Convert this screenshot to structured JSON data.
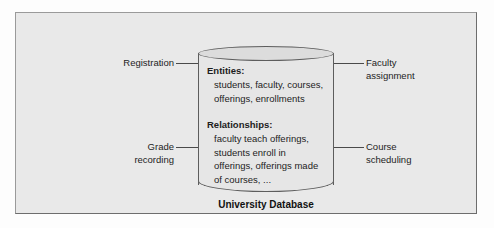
{
  "diagram": {
    "caption": "University Database",
    "cylinder": {
      "entities_heading": "Entities:",
      "entities_text": "students, faculty, courses, offerings, enrollments",
      "relationships_heading": "Relationships:",
      "relationships_text": "faculty teach offerings, students enroll in offerings, offerings made of courses, ..."
    },
    "callouts": [
      {
        "id": "registration",
        "label": "Registration",
        "side": "left",
        "position": "top"
      },
      {
        "id": "grade",
        "label": "Grade\nrecording",
        "side": "left",
        "position": "bottom"
      },
      {
        "id": "faculty",
        "label": "Faculty\nassignment",
        "side": "right",
        "position": "top"
      },
      {
        "id": "course",
        "label": "Course\nscheduling",
        "side": "right",
        "position": "bottom"
      }
    ],
    "colors": {
      "panel_background": "#e9e9e9",
      "panel_border": "#9a9a9a",
      "cylinder_fill": "#e6e6e6",
      "cylinder_stroke": "#5d5d5d",
      "text": "#1d1d1d",
      "connector": "#4a4a4a"
    }
  }
}
